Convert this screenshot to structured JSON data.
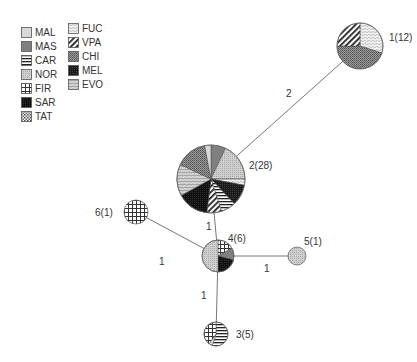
{
  "legend": {
    "columns": [
      [
        {
          "key": "MAL",
          "label": "MAL",
          "pattern": "p-mal"
        },
        {
          "key": "MAS",
          "label": "MAS",
          "pattern": "p-mas"
        },
        {
          "key": "CAR",
          "label": "CAR",
          "pattern": "p-car"
        },
        {
          "key": "NOR",
          "label": "NOR",
          "pattern": "p-nor"
        },
        {
          "key": "FIR",
          "label": "FIR",
          "pattern": "p-fir"
        },
        {
          "key": "SAR",
          "label": "SAR",
          "pattern": "p-sar"
        },
        {
          "key": "TAT",
          "label": "TAT",
          "pattern": "p-tat"
        }
      ],
      [
        {
          "key": "FUC",
          "label": "FUC",
          "pattern": "p-fuc"
        },
        {
          "key": "VPA",
          "label": "VPA",
          "pattern": "p-vpa"
        },
        {
          "key": "CHI",
          "label": "CHI",
          "pattern": "p-chi"
        },
        {
          "key": "MEL",
          "label": "MEL",
          "pattern": "p-mel"
        },
        {
          "key": "EVO",
          "label": "EVO",
          "pattern": "p-evo"
        }
      ]
    ]
  },
  "nodes": [
    {
      "id": "1",
      "label": "1(12)",
      "cx": 360,
      "cy": 46,
      "r": 23,
      "label_x": 389,
      "label_y": 32,
      "slices": [
        {
          "pop": "FUC",
          "frac": 0.3
        },
        {
          "pop": "CHI",
          "frac": 0.45
        },
        {
          "pop": "VPA",
          "frac": 0.25
        }
      ]
    },
    {
      "id": "2",
      "label": "2(28)",
      "cx": 211,
      "cy": 179,
      "r": 34,
      "label_x": 249,
      "label_y": 160,
      "slices": [
        {
          "pop": "MAS",
          "frac": 0.07
        },
        {
          "pop": "NOR",
          "frac": 0.18
        },
        {
          "pop": "FUC",
          "frac": 0.03
        },
        {
          "pop": "MEL",
          "frac": 0.1
        },
        {
          "pop": "CAR",
          "frac": 0.07
        },
        {
          "pop": "VPA",
          "frac": 0.07
        },
        {
          "pop": "SAR",
          "frac": 0.15
        },
        {
          "pop": "EVO",
          "frac": 0.15
        },
        {
          "pop": "CHI",
          "frac": 0.15
        },
        {
          "pop": "MAL",
          "frac": 0.03
        }
      ]
    },
    {
      "id": "3",
      "label": "3(5)",
      "cx": 216,
      "cy": 334,
      "r": 12,
      "label_x": 236,
      "label_y": 329,
      "slices": [
        {
          "pop": "CAR",
          "frac": 0.55
        },
        {
          "pop": "MAL",
          "frac": 0.05
        },
        {
          "pop": "FIR",
          "frac": 0.4
        }
      ]
    },
    {
      "id": "4",
      "label": "4(6)",
      "cx": 218,
      "cy": 256,
      "r": 16,
      "label_x": 228,
      "label_y": 233,
      "slices": [
        {
          "pop": "FIR",
          "frac": 0.17
        },
        {
          "pop": "MAS",
          "frac": 0.12
        },
        {
          "pop": "SAR",
          "frac": 0.21
        },
        {
          "pop": "NOR",
          "frac": 0.5
        }
      ]
    },
    {
      "id": "5",
      "label": "5(1)",
      "cx": 297,
      "cy": 256,
      "r": 9,
      "label_x": 304,
      "label_y": 236,
      "slices": [
        {
          "pop": "NOR",
          "frac": 1.0
        }
      ]
    },
    {
      "id": "6",
      "label": "6(1)",
      "cx": 136,
      "cy": 212,
      "r": 12,
      "label_x": 95,
      "label_y": 207,
      "slices": [
        {
          "pop": "FIR",
          "frac": 1.0
        }
      ]
    }
  ],
  "edges": [
    {
      "from": "1",
      "to": "2",
      "weight": "2",
      "label_x": 286,
      "label_y": 88
    },
    {
      "from": "2",
      "to": "4",
      "weight": "1",
      "label_x": 206,
      "label_y": 221
    },
    {
      "from": "6",
      "to": "4",
      "weight": "1",
      "label_x": 159,
      "label_y": 256
    },
    {
      "from": "4",
      "to": "5",
      "weight": "1",
      "label_x": 264,
      "label_y": 263
    },
    {
      "from": "4",
      "to": "3",
      "weight": "1",
      "label_x": 201,
      "label_y": 290
    }
  ]
}
